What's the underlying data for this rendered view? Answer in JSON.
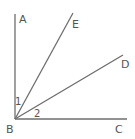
{
  "diagram": {
    "type": "geometry-angles",
    "colors": {
      "line": "#6e6e6e",
      "label": "#555555",
      "background": "#ffffff"
    },
    "vertex": {
      "name": "B",
      "x": 15,
      "y": 119
    },
    "rays": [
      {
        "name": "BA",
        "to": "A",
        "x2": 15,
        "y2": 14
      },
      {
        "name": "BE",
        "to": "E",
        "x2": 73,
        "y2": 13
      },
      {
        "name": "BD",
        "to": "D",
        "x2": 123,
        "y2": 55
      },
      {
        "name": "BC",
        "to": "C",
        "x2": 127,
        "y2": 119
      }
    ],
    "point_labels": {
      "A": "A",
      "E": "E",
      "D": "D",
      "B": "B",
      "C": "C"
    },
    "angle_labels": {
      "angle1": "1",
      "angle2": "2"
    }
  }
}
